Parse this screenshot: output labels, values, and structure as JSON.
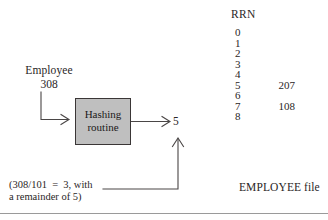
{
  "figure": {
    "input": {
      "label": "Employee",
      "value": "308"
    },
    "process_box": {
      "line1": "Hashing",
      "line2": "routine",
      "fill_color": "#bfbfbf",
      "border_color": "#3a3636"
    },
    "output": {
      "value": "5"
    },
    "caption": {
      "line1": "(308/101  =  3, with",
      "line2": "a remainder of 5)"
    },
    "file": {
      "header": "RRN",
      "label": "EMPLOYEE file",
      "rows": [
        {
          "index": "0",
          "value": ""
        },
        {
          "index": "1",
          "value": ""
        },
        {
          "index": "2",
          "value": ""
        },
        {
          "index": "3",
          "value": ""
        },
        {
          "index": "4",
          "value": ""
        },
        {
          "index": "5",
          "value": "207"
        },
        {
          "index": "6",
          "value": ""
        },
        {
          "index": "7",
          "value": "108"
        },
        {
          "index": "8",
          "value": ""
        }
      ]
    },
    "colors": {
      "ink": "#2a2626",
      "line": "#4a4646",
      "rule": "#9a9a9a"
    }
  }
}
